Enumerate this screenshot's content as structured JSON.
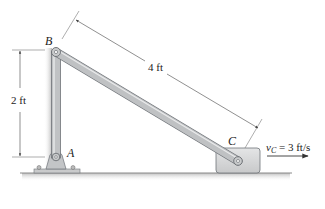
{
  "diagram": {
    "type": "mechanism-linkage",
    "points": {
      "A": {
        "label": "A",
        "role": "fixed pin support"
      },
      "B": {
        "label": "B",
        "role": "pin joint between links"
      },
      "C": {
        "label": "C",
        "role": "pin on sliding block"
      }
    },
    "links": [
      {
        "name": "AB",
        "from": "A",
        "to": "B",
        "orientation": "vertical"
      },
      {
        "name": "BC",
        "from": "B",
        "to": "C",
        "orientation": "inclined"
      }
    ],
    "dimensions": {
      "height_AB": "2 ft",
      "length_BC": "4 ft"
    },
    "velocity": {
      "symbol": "v",
      "subscript": "C",
      "equals": " = 3 ft/s",
      "direction": "right"
    },
    "caption": ""
  },
  "colors": {
    "link": "#b9bcbf",
    "link_edge": "#6f7378",
    "block": "#d6d7d8",
    "ground_shadow": "#c9c9c9",
    "dimension_line": "#555555",
    "text": "#222222"
  }
}
